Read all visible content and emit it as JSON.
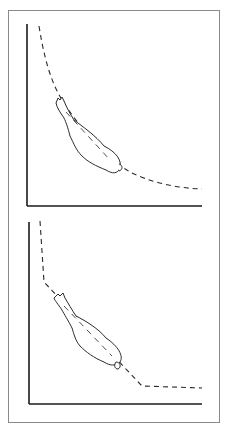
{
  "figure": {
    "panels": [
      {
        "id": "top",
        "curve_type": "smooth-hyperbolic",
        "description": "Dashed smooth decreasing curve with a gourd-shaped figure lying along it"
      },
      {
        "id": "bottom",
        "curve_type": "piecewise-linear",
        "description": "Dashed kinked curve: vertical, diagonal, then flat, with a gourd-shaped figure along the diagonal"
      }
    ],
    "colors": {
      "line": "#1a1a1a",
      "border": "#8a8a8a",
      "background": "#ffffff"
    }
  }
}
